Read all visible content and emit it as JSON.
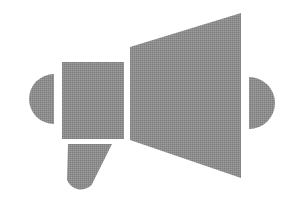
{
  "canvas": {
    "width": 295,
    "height": 217,
    "background_color": "#ffffff",
    "title": "Megaphone"
  },
  "icon": {
    "name": "megaphone-icon",
    "label": "Megaphone",
    "style": "solid-silhouette",
    "fill_color": "#8a8a8a",
    "texture": "dithered-halftone",
    "parts": [
      {
        "name": "left-cap",
        "label": "Left rounded cap",
        "shape": "semicircle-left",
        "center_x": 54,
        "center_y": 99,
        "radius": 25
      },
      {
        "name": "body",
        "label": "Megaphone body",
        "shape": "rectangle",
        "x": 62,
        "y": 62,
        "width": 62,
        "height": 77
      },
      {
        "name": "horn",
        "label": "Megaphone horn",
        "shape": "trapezoid",
        "points": "130,47 241,13 241,178 130,140"
      },
      {
        "name": "handle",
        "label": "Megaphone handle",
        "shape": "slanted-rounded-bar",
        "x": 62,
        "y": 144,
        "width": 50,
        "height": 56,
        "angle_degrees": 20
      },
      {
        "name": "sound-wave",
        "label": "Sound wave arc",
        "shape": "semicircle-right",
        "center_x": 249,
        "center_y": 103,
        "radius": 26
      }
    ]
  }
}
